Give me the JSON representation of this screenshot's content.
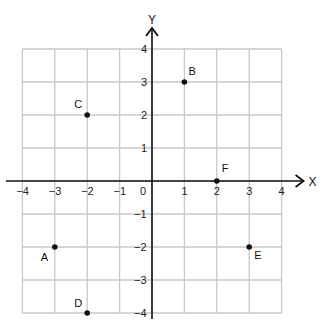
{
  "chart_data": {
    "type": "scatter",
    "title": "",
    "xlabel": "X",
    "ylabel": "Y",
    "xlim": [
      -4,
      4
    ],
    "ylim": [
      -4,
      4
    ],
    "grid": true,
    "x_ticks": [
      -4,
      -3,
      -2,
      -1,
      0,
      1,
      2,
      3,
      4
    ],
    "y_ticks": [
      -4,
      -3,
      -2,
      -1,
      1,
      2,
      3,
      4
    ],
    "tick_labels": {
      "x": [
        "−4",
        "−3",
        "−2",
        "−1",
        "0",
        "1",
        "2",
        "3",
        "4"
      ],
      "y": [
        "−4",
        "−3",
        "−2",
        "−1",
        "1",
        "2",
        "3",
        "4"
      ]
    },
    "points": [
      {
        "label": "A",
        "x": -3,
        "y": -2
      },
      {
        "label": "B",
        "x": 1,
        "y": 3
      },
      {
        "label": "C",
        "x": -2,
        "y": 2
      },
      {
        "label": "D",
        "x": -2,
        "y": -4
      },
      {
        "label": "E",
        "x": 3,
        "y": -2
      },
      {
        "label": "F",
        "x": 2,
        "y": 0
      }
    ],
    "legend": null
  },
  "colors": {
    "grid": "#c8c8c8",
    "axis": "#111111",
    "point": "#111111"
  }
}
